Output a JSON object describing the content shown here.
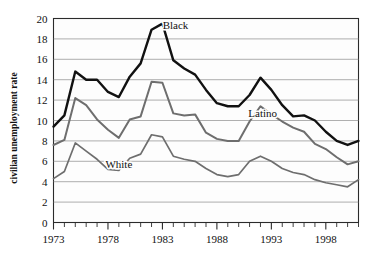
{
  "chart_data": {
    "type": "line",
    "title": "",
    "xlabel": "",
    "ylabel": "civilian unemployment rate",
    "xlim": [
      1973,
      2001
    ],
    "ylim": [
      0,
      20
    ],
    "ytick_step": 2,
    "grid": true,
    "legend": "inline-labels",
    "x": [
      1973,
      1974,
      1975,
      1976,
      1977,
      1978,
      1979,
      1980,
      1981,
      1982,
      1983,
      1984,
      1985,
      1986,
      1987,
      1988,
      1989,
      1990,
      1991,
      1992,
      1993,
      1994,
      1995,
      1996,
      1997,
      1998,
      1999,
      2000,
      2001
    ],
    "xticks": [
      1973,
      1974,
      1975,
      1976,
      1977,
      1978,
      1979,
      1980,
      1981,
      1982,
      1983,
      1984,
      1985,
      1986,
      1987,
      1988,
      1989,
      1990,
      1991,
      1992,
      1993,
      1994,
      1995,
      1996,
      1997,
      1998,
      1999,
      2000,
      2001
    ],
    "xtick_labels": [
      "1973",
      "1978",
      "1983",
      "1988",
      "1993",
      "1998"
    ],
    "xtick_label_years": [
      1973,
      1978,
      1983,
      1988,
      1993,
      1998
    ],
    "yticks": [
      0,
      2,
      4,
      6,
      8,
      10,
      12,
      14,
      16,
      18,
      20
    ],
    "ytick_labels": [
      "0",
      "2",
      "4",
      "6",
      "8",
      "10",
      "12",
      "14",
      "16",
      "18",
      "20"
    ],
    "series": [
      {
        "name": "Black",
        "label": "Black",
        "color": "#111111",
        "width": 2.4,
        "label_x": 1984.2,
        "label_y": 19.0,
        "values": [
          9.4,
          10.5,
          14.8,
          14.0,
          14.0,
          12.8,
          12.3,
          14.3,
          15.6,
          18.9,
          19.5,
          15.9,
          15.1,
          14.5,
          13.0,
          11.7,
          11.4,
          11.4,
          12.5,
          14.2,
          13.0,
          11.5,
          10.4,
          10.5,
          10.0,
          8.9,
          8.0,
          7.6,
          8.0
        ]
      },
      {
        "name": "Latino",
        "label": "Latino",
        "color": "#6e6e6e",
        "width": 2.0,
        "label_x": 1992.2,
        "label_y": 10.3,
        "values": [
          7.6,
          8.1,
          12.2,
          11.5,
          10.1,
          9.1,
          8.3,
          10.1,
          10.4,
          13.8,
          13.7,
          10.7,
          10.5,
          10.6,
          8.8,
          8.2,
          8.0,
          8.0,
          9.9,
          11.4,
          10.6,
          9.9,
          9.3,
          8.9,
          7.7,
          7.2,
          6.4,
          5.7,
          6.0
        ]
      },
      {
        "name": "White",
        "label": "White",
        "color": "#6e6e6e",
        "width": 1.7,
        "label_x": 1979.0,
        "label_y": 5.3,
        "values": [
          4.3,
          5.0,
          7.8,
          7.0,
          6.2,
          5.2,
          5.1,
          6.3,
          6.7,
          8.6,
          8.4,
          6.5,
          6.2,
          6.0,
          5.3,
          4.7,
          4.5,
          4.7,
          6.0,
          6.5,
          6.0,
          5.3,
          4.9,
          4.7,
          4.2,
          3.9,
          3.7,
          3.5,
          4.2
        ]
      }
    ]
  }
}
